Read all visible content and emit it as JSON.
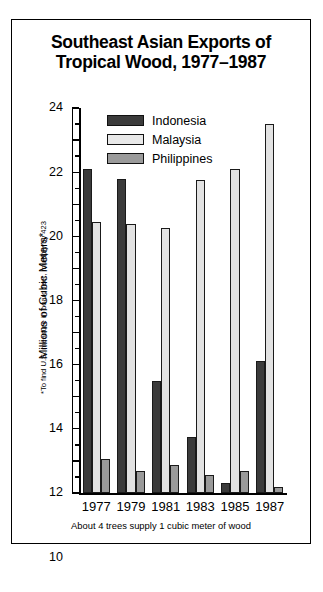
{
  "figure": {
    "title_line1": "Southeast Asian Exports of",
    "title_line2": "Tropical Wood, 1977–1987",
    "caption": "About 4 trees supply 1 cubic meter of wood",
    "ylabel": "Millions of Cubic Meters*",
    "ylabel_footnote": "*To find U.S. measure in board feet, multiply by 423"
  },
  "legend": {
    "position": "top-center-inside",
    "items": [
      {
        "label": "Indonesia",
        "color": "#3b3b3b"
      },
      {
        "label": "Malaysia",
        "color": "#e8e8e8"
      },
      {
        "label": "Philippines",
        "color": "#9a9a9a"
      }
    ]
  },
  "chart_data": {
    "type": "bar",
    "title": "Southeast Asian Exports of Tropical Wood, 1977–1987",
    "subtitle": "",
    "xlabel": "",
    "ylabel": "Millions of Cubic Meters*",
    "ylim": [
      0,
      24
    ],
    "ytick_step": 2,
    "yminor_step": 1,
    "grid": false,
    "legend_position": "inside top center",
    "annotation": "About 4 trees supply 1 cubic meter of wood",
    "footnote": "*To find U.S. measure in board feet, multiply by 423",
    "categories": [
      "1977",
      "1979",
      "1981",
      "1983",
      "1985",
      "1987"
    ],
    "ytick_labels": [
      "0",
      "2",
      "4",
      "6",
      "8",
      "10",
      "12",
      "14",
      "16",
      "18",
      "20",
      "22",
      "24"
    ],
    "series": [
      {
        "name": "Indonesia",
        "color": "#3b3b3b",
        "values": [
          20.2,
          19.6,
          7.0,
          3.5,
          0.65,
          8.2
        ]
      },
      {
        "name": "Malaysia",
        "color": "#e2e2e2",
        "values": [
          16.9,
          16.8,
          16.5,
          19.5,
          20.2,
          23.0
        ]
      },
      {
        "name": "Philippines",
        "color": "#9a9a9a",
        "values": [
          2.1,
          1.35,
          1.75,
          1.1,
          1.4,
          0.35
        ]
      }
    ]
  }
}
